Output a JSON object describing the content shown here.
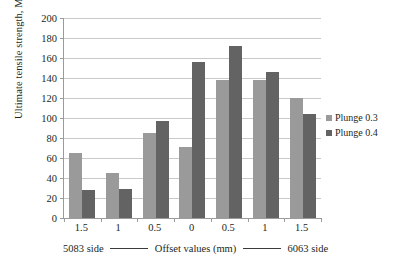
{
  "chart_data": {
    "type": "bar",
    "title": "",
    "xlabel": "Offset values (mm)",
    "ylabel": "Ultimate tensile strength, Mpa",
    "categories": [
      "1.5",
      "1",
      "0.5",
      "0",
      "0.5",
      "1",
      "1.5"
    ],
    "series": [
      {
        "name": "Plunge 0.3",
        "color": "#9a9a9a",
        "values": [
          65,
          45,
          85,
          71,
          138,
          138,
          120
        ]
      },
      {
        "name": "Plunge 0.4",
        "color": "#636363",
        "values": [
          28,
          29,
          97,
          156,
          172,
          146,
          104
        ]
      }
    ],
    "ylim": [
      0,
      200
    ],
    "yticks": [
      0,
      20,
      40,
      60,
      80,
      100,
      120,
      140,
      160,
      180,
      200
    ],
    "ytick_labels": [
      "0",
      "20",
      "40",
      "60",
      "80",
      "100",
      "120",
      "140",
      "160",
      "180",
      "200"
    ],
    "grid": true,
    "legend_position": "right"
  },
  "axis": {
    "left_side_label": "5083 side",
    "center_label": "Offset values (mm)",
    "right_side_label": "6063 side"
  },
  "legend": {
    "items": [
      {
        "label": "Plunge 0.3",
        "color": "#9a9a9a"
      },
      {
        "label": "Plunge 0.4",
        "color": "#636363"
      }
    ]
  }
}
